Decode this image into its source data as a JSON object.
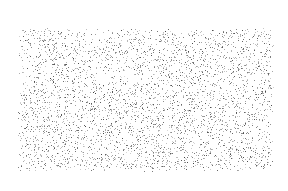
{
  "canvas": {
    "width": 288,
    "height": 191,
    "background": "#ffffff"
  },
  "texture": {
    "type": "speckle-noise",
    "region": {
      "x": 17,
      "y": 27,
      "width": 258,
      "height": 146
    },
    "dot_color": "#505050",
    "density": 0.11,
    "seed": 7
  }
}
